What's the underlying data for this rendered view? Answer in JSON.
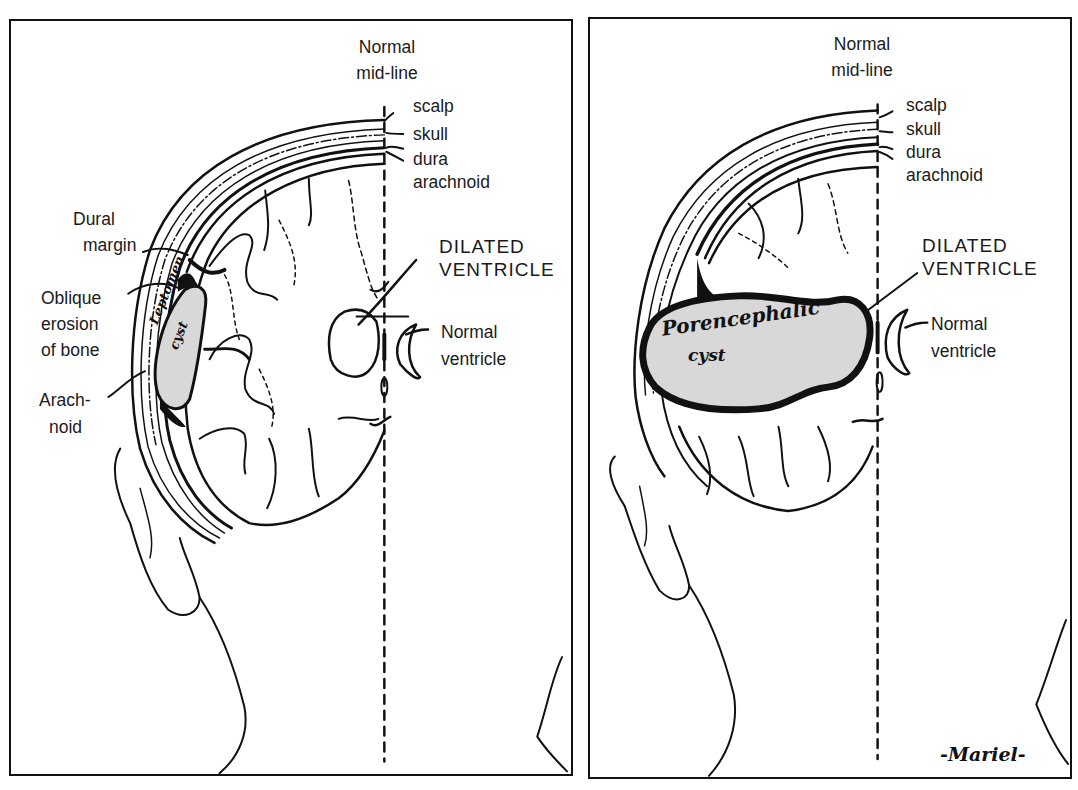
{
  "left_panel": {
    "labels": {
      "midline_line1": "Normal",
      "midline_line2": "mid-line",
      "scalp": "scalp",
      "skull": "skull",
      "dura": "dura",
      "arachnoid": "arachnoid",
      "dural_margin_1": "Dural",
      "dural_margin_2": "margin",
      "oblique_1": "Oblique",
      "oblique_2": "erosion",
      "oblique_3": "of bone",
      "arach_1": "Arach-",
      "arach_2": "noid",
      "dilated_1": "DILATED",
      "dilated_2": "VENTRICLE",
      "normal_vent_1": "Normal",
      "normal_vent_2": "ventricle"
    },
    "cyst_label_1": "Leptomen.",
    "cyst_label_2": "cyst"
  },
  "right_panel": {
    "labels": {
      "midline_line1": "Normal",
      "midline_line2": "mid-line",
      "scalp": "scalp",
      "skull": "skull",
      "dura": "dura",
      "arachnoid": "arachnoid",
      "dilated_1": "DILATED",
      "dilated_2": "VENTRICLE",
      "normal_vent_1": "Normal",
      "normal_vent_2": "ventricle"
    },
    "cyst_label_1": "Porencephalic",
    "cyst_label_2": "cyst",
    "signature": "-Mariel-"
  }
}
